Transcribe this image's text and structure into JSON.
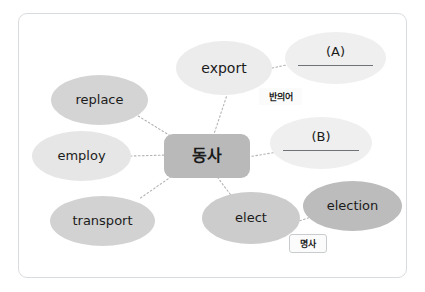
{
  "diagram": {
    "type": "mind-map",
    "title_node": {
      "id": "center",
      "label": "동사",
      "meaning": "verb",
      "shape": "rounded-rect",
      "color": "#b9b9b9"
    },
    "nodes": [
      {
        "id": "export",
        "label": "export",
        "shape": "ellipse",
        "color": "#ececec",
        "x": 176,
        "y": 41,
        "w": 96,
        "h": 54
      },
      {
        "id": "blank-a",
        "label": "(A)",
        "shape": "ellipse",
        "color": "#efefef",
        "has_answer_line": true,
        "x": 285,
        "y": 32,
        "w": 101,
        "h": 52
      },
      {
        "id": "replace",
        "label": "replace",
        "shape": "ellipse",
        "color": "#d4d4d4",
        "x": 51,
        "y": 75,
        "w": 97,
        "h": 50
      },
      {
        "id": "employ",
        "label": "employ",
        "shape": "ellipse",
        "color": "#e6e6e6",
        "x": 32,
        "y": 131,
        "w": 99,
        "h": 50
      },
      {
        "id": "blank-b",
        "label": "(B)",
        "shape": "ellipse",
        "color": "#efefef",
        "has_answer_line": true,
        "x": 270,
        "y": 117,
        "w": 102,
        "h": 52
      },
      {
        "id": "transport",
        "label": "transport",
        "shape": "ellipse",
        "color": "#d2d2d2",
        "x": 50,
        "y": 196,
        "w": 105,
        "h": 50
      },
      {
        "id": "elect",
        "label": "elect",
        "shape": "ellipse",
        "color": "#cccccc",
        "x": 202,
        "y": 192,
        "w": 98,
        "h": 52
      },
      {
        "id": "election",
        "label": "election",
        "shape": "ellipse",
        "color": "#bcbcbc",
        "x": 303,
        "y": 181,
        "w": 99,
        "h": 50
      }
    ],
    "tags": [
      {
        "id": "antonym-tag",
        "label": "반의어",
        "meaning": "antonym",
        "bordered": false,
        "x": 259,
        "y": 88,
        "w": 43,
        "h": 17
      },
      {
        "id": "noun-tag",
        "label": "명사",
        "meaning": "noun",
        "bordered": true,
        "x": 289,
        "y": 234,
        "w": 38,
        "h": 19
      }
    ],
    "connectors": [
      {
        "from": "center",
        "to": "export",
        "style": "dotted"
      },
      {
        "from": "center",
        "to": "replace",
        "style": "dotted"
      },
      {
        "from": "center",
        "to": "employ",
        "style": "dotted"
      },
      {
        "from": "center",
        "to": "transport",
        "style": "dotted"
      },
      {
        "from": "center",
        "to": "blank-b",
        "style": "dotted"
      },
      {
        "from": "center",
        "to": "elect",
        "style": "dotted"
      },
      {
        "from": "export",
        "to": "blank-a",
        "style": "dotted"
      },
      {
        "from": "elect",
        "to": "election",
        "style": "dotted"
      }
    ],
    "colors": {
      "frame_border": "#d9dcdf",
      "connector": "#b3b3b3",
      "text": "#1b1b1b",
      "answer_line": "#6f7276",
      "background": "#ffffff"
    }
  }
}
